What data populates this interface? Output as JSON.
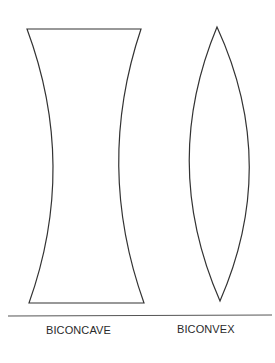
{
  "diagram": {
    "title": "",
    "stroke_color": "#333333",
    "background": "#ffffff",
    "lenses": [
      {
        "id": "biconcave",
        "label": "BICONCAVE"
      },
      {
        "id": "biconvex",
        "label": "BICONVEX"
      }
    ]
  }
}
